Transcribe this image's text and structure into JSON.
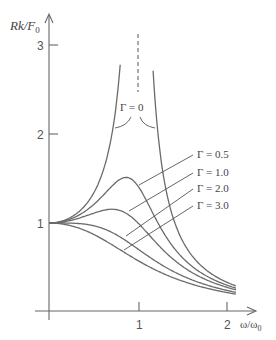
{
  "chart_data": {
    "type": "line",
    "title": "",
    "xlabel": "ω/ω0",
    "ylabel": "Rk/F0",
    "xlim": [
      0,
      2.1
    ],
    "ylim": [
      0,
      3.2
    ],
    "grid": false,
    "x_ticks": [
      1,
      2
    ],
    "y_ticks": [
      1,
      2,
      3
    ],
    "formula": "Rk/F0 = 1 / sqrt((1 - u^2)^2 + Γ u^2), u = ω/ω0",
    "series": [
      {
        "name": "Γ = 0",
        "x": [
          0,
          0.5,
          0.75,
          0.9
        ],
        "values": [
          1.0,
          1.33,
          2.29,
          5.26
        ],
        "note": "diverges at ω/ω0 = 1 (dashed asymptote)"
      },
      {
        "name": "Γ = 0.5",
        "x": [
          0,
          0.5,
          0.87,
          1.0,
          1.5,
          2.0
        ],
        "values": [
          1.0,
          1.21,
          1.51,
          1.41,
          0.64,
          0.31
        ]
      },
      {
        "name": "Γ = 1.0",
        "x": [
          0,
          0.5,
          0.71,
          1.0,
          1.5,
          2.0
        ],
        "values": [
          1.0,
          1.11,
          1.15,
          1.0,
          0.59,
          0.3
        ]
      },
      {
        "name": "Γ = 2.0",
        "x": [
          0,
          0.5,
          1.0,
          1.5,
          2.0
        ],
        "values": [
          1.0,
          0.94,
          0.71,
          0.49,
          0.28
        ]
      },
      {
        "name": "Γ = 3.0",
        "x": [
          0,
          0.5,
          1.0,
          1.5,
          2.0
        ],
        "values": [
          1.0,
          0.83,
          0.58,
          0.42,
          0.26
        ]
      }
    ],
    "annotations": [
      "Γ = 0",
      "Γ = 0.5",
      "Γ = 1.0",
      "Γ = 2.0",
      "Γ = 3.0"
    ]
  },
  "axes": {
    "y_label_main": "Rk/F",
    "y_label_sub": "0",
    "x_label_main": "ω/ω",
    "x_label_sub": "0",
    "x_tick_labels": [
      "1",
      "2"
    ],
    "y_tick_labels": [
      "1",
      "2",
      "3"
    ]
  },
  "labels": {
    "gamma0": "Γ = 0",
    "gamma05": "Γ = 0.5",
    "gamma1": "Γ = 1.0",
    "gamma2": "Γ = 2.0",
    "gamma3": "Γ = 3.0"
  },
  "colors": {
    "curve": "#6a6a6a",
    "axis": "#666666",
    "text": "#444444"
  }
}
